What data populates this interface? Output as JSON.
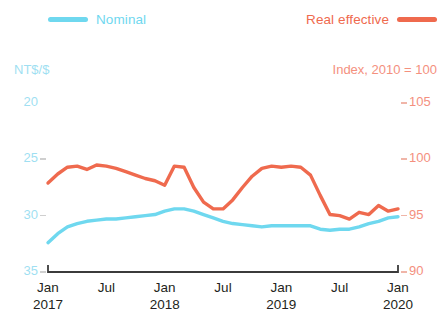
{
  "legend": {
    "nominal": {
      "label": "Nominal",
      "color": "#6fd8ef"
    },
    "real_effective": {
      "label": "Real effective",
      "color": "#ef6a4e"
    }
  },
  "axes": {
    "left_title": "NT$/$",
    "right_title": "Index, 2010 = 100",
    "left_ticks": [
      "20",
      "25",
      "30",
      "35"
    ],
    "right_ticks": [
      "105",
      "100",
      "95",
      "90"
    ],
    "x_months": [
      "Jan",
      "Jul",
      "Jan",
      "Jul",
      "Jan",
      "Jul",
      "Jan"
    ],
    "x_years": [
      "2017",
      "",
      "2018",
      "",
      "2019",
      "",
      "2020"
    ]
  },
  "chart_data": {
    "type": "line",
    "title": "",
    "xlabel": "",
    "ylabel": "NT$/$",
    "y2label": "Index, 2010 = 100",
    "grid": false,
    "legend_position": "top",
    "ylim": [
      35,
      20
    ],
    "y2lim": [
      90,
      105
    ],
    "y_inverted": true,
    "x": [
      "2017-01",
      "2017-02",
      "2017-03",
      "2017-04",
      "2017-05",
      "2017-06",
      "2017-07",
      "2017-08",
      "2017-09",
      "2017-10",
      "2017-11",
      "2017-12",
      "2018-01",
      "2018-02",
      "2018-03",
      "2018-04",
      "2018-05",
      "2018-06",
      "2018-07",
      "2018-08",
      "2018-09",
      "2018-10",
      "2018-11",
      "2018-12",
      "2019-01",
      "2019-02",
      "2019-03",
      "2019-04",
      "2019-05",
      "2019-06",
      "2019-07",
      "2019-08",
      "2019-09",
      "2019-10",
      "2019-11",
      "2019-12",
      "2020-01"
    ],
    "x_tick_labels": [
      "Jan 2017",
      "Jul",
      "Jan 2018",
      "Jul",
      "Jan 2019",
      "Jul",
      "Jan 2020"
    ],
    "series": [
      {
        "name": "Nominal",
        "axis": "left",
        "color": "#6fd8ef",
        "unit": "NT$/$",
        "values": [
          32.4,
          31.6,
          31.0,
          30.7,
          30.5,
          30.4,
          30.3,
          30.3,
          30.2,
          30.1,
          30.0,
          29.9,
          29.6,
          29.4,
          29.4,
          29.6,
          29.9,
          30.2,
          30.5,
          30.7,
          30.8,
          30.9,
          31.0,
          30.9,
          30.9,
          30.9,
          30.9,
          30.9,
          31.2,
          31.3,
          31.2,
          31.2,
          31.0,
          30.7,
          30.5,
          30.2,
          30.1
        ]
      },
      {
        "name": "Real effective",
        "axis": "right",
        "color": "#ef6a4e",
        "unit": "Index, 2010 = 100",
        "values": [
          97.9,
          98.7,
          99.3,
          99.4,
          99.1,
          99.5,
          99.4,
          99.2,
          98.9,
          98.6,
          98.3,
          98.1,
          97.7,
          99.4,
          99.3,
          97.5,
          96.2,
          95.6,
          95.6,
          96.4,
          97.5,
          98.5,
          99.2,
          99.4,
          99.3,
          99.4,
          99.3,
          98.6,
          96.8,
          95.1,
          95.0,
          94.7,
          95.3,
          95.1,
          95.9,
          95.4,
          95.6
        ]
      }
    ]
  },
  "plot_geometry": {
    "x_left": 48,
    "x_right": 398,
    "y_top": 103,
    "y_bottom": 272
  }
}
